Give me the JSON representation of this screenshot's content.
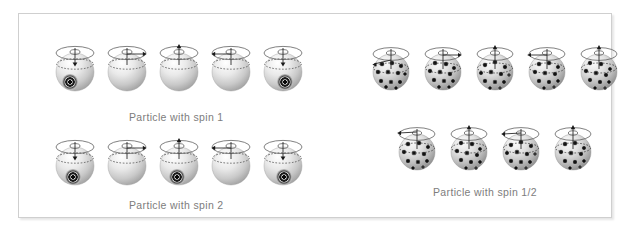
{
  "figure": {
    "background_color": "#ffffff",
    "panel": {
      "border_color": "#cfcfcf",
      "fill_color": "#ffffff"
    },
    "caption_color": "#7d7d7d"
  },
  "groups": [
    {
      "id": "spin-1",
      "caption": "Particle with spin 1",
      "sphere_count": 5,
      "sphere_style": "plain-shaded",
      "marker": "bullseye",
      "rotation_states": [
        {
          "index": 0,
          "arrow": "down-left",
          "marker_visible": true
        },
        {
          "index": 1,
          "arrow": "right",
          "marker_visible": false
        },
        {
          "index": 2,
          "arrow": "up",
          "marker_visible": false
        },
        {
          "index": 3,
          "arrow": "left",
          "marker_visible": false
        },
        {
          "index": 4,
          "arrow": "down",
          "marker_visible": true
        }
      ]
    },
    {
      "id": "spin-2",
      "caption": "Particle with spin 2",
      "sphere_count": 5,
      "sphere_style": "plain-shaded",
      "marker": "bullseye",
      "rotation_states": [
        {
          "index": 0,
          "arrow": "down",
          "marker_visible": true
        },
        {
          "index": 1,
          "arrow": "right",
          "marker_visible": false
        },
        {
          "index": 2,
          "arrow": "up",
          "marker_visible": true
        },
        {
          "index": 3,
          "arrow": "left",
          "marker_visible": false
        },
        {
          "index": 4,
          "arrow": "down",
          "marker_visible": true
        }
      ]
    },
    {
      "id": "spin-half",
      "caption": "Particle with spin 1/2",
      "sphere_count": 9,
      "rows": [
        5,
        4
      ],
      "sphere_style": "spotted",
      "marker": "spots",
      "rotation_states": [
        {
          "index": 0,
          "arrow": "left",
          "marker_visible": true
        },
        {
          "index": 1,
          "arrow": "right",
          "marker_visible": true
        },
        {
          "index": 2,
          "arrow": "up",
          "marker_visible": true
        },
        {
          "index": 3,
          "arrow": "left",
          "marker_visible": true
        },
        {
          "index": 4,
          "arrow": "up",
          "marker_visible": true
        },
        {
          "index": 5,
          "arrow": "left",
          "marker_visible": true
        },
        {
          "index": 6,
          "arrow": "up",
          "marker_visible": true
        },
        {
          "index": 7,
          "arrow": "left",
          "marker_visible": true
        },
        {
          "index": 8,
          "arrow": "up",
          "marker_visible": true
        }
      ]
    }
  ],
  "captions": {
    "spin_1": "Particle with spin 1",
    "spin_2": "Particle with spin 2",
    "spin_half": "Particle with spin 1/2"
  }
}
